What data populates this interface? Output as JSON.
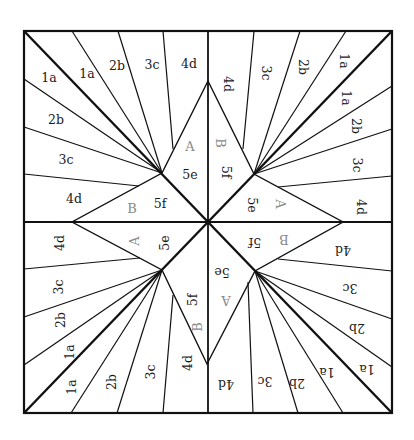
{
  "colors": {
    "line": "#111111",
    "label": "#1a1a1a",
    "section_label": "#8a8a8a",
    "background": "#ffffff"
  },
  "square": {
    "x1": 24,
    "y1": 31,
    "x2": 392,
    "y2": 413
  },
  "center": {
    "x": 208,
    "y": 222
  },
  "star": {
    "outer_points": {
      "top": {
        "x": 208,
        "y": 81
      },
      "right": {
        "x": 343,
        "y": 222
      },
      "bottom": {
        "x": 207,
        "y": 364
      },
      "left": {
        "x": 72,
        "y": 222
      }
    },
    "inner_vertices": {
      "top_left": {
        "x": 162,
        "y": 173
      },
      "top_right": {
        "x": 254,
        "y": 174
      },
      "bottom_left": {
        "x": 162,
        "y": 270
      },
      "bottom_right": {
        "x": 255,
        "y": 271
      }
    }
  },
  "diagonals": [
    {
      "x1": 24,
      "y1": 31,
      "x2": 392,
      "y2": 413
    },
    {
      "x1": 392,
      "y1": 31,
      "x2": 24,
      "y2": 413
    }
  ],
  "fan_lines": [
    {
      "x1": 72,
      "y1": 31,
      "x2": 162,
      "y2": 173
    },
    {
      "x1": 118,
      "y1": 31,
      "x2": 162,
      "y2": 173
    },
    {
      "x1": 163,
      "y1": 31,
      "x2": 173,
      "y2": 149
    },
    {
      "x1": 24,
      "y1": 79,
      "x2": 162,
      "y2": 173
    },
    {
      "x1": 24,
      "y1": 127,
      "x2": 162,
      "y2": 173
    },
    {
      "x1": 24,
      "y1": 174,
      "x2": 139,
      "y2": 186
    },
    {
      "x1": 346,
      "y1": 31,
      "x2": 254,
      "y2": 174
    },
    {
      "x1": 300,
      "y1": 31,
      "x2": 254,
      "y2": 174
    },
    {
      "x1": 254,
      "y1": 31,
      "x2": 243,
      "y2": 149
    },
    {
      "x1": 392,
      "y1": 86,
      "x2": 254,
      "y2": 174
    },
    {
      "x1": 392,
      "y1": 129,
      "x2": 254,
      "y2": 174
    },
    {
      "x1": 392,
      "y1": 176,
      "x2": 278,
      "y2": 187
    },
    {
      "x1": 24,
      "y1": 365,
      "x2": 162,
      "y2": 270
    },
    {
      "x1": 24,
      "y1": 317,
      "x2": 162,
      "y2": 270
    },
    {
      "x1": 24,
      "y1": 269,
      "x2": 140,
      "y2": 258
    },
    {
      "x1": 71,
      "y1": 413,
      "x2": 162,
      "y2": 270
    },
    {
      "x1": 117,
      "y1": 413,
      "x2": 162,
      "y2": 270
    },
    {
      "x1": 163,
      "y1": 413,
      "x2": 173,
      "y2": 295
    },
    {
      "x1": 392,
      "y1": 367,
      "x2": 255,
      "y2": 271
    },
    {
      "x1": 392,
      "y1": 319,
      "x2": 255,
      "y2": 271
    },
    {
      "x1": 392,
      "y1": 271,
      "x2": 278,
      "y2": 259
    },
    {
      "x1": 343,
      "y1": 413,
      "x2": 255,
      "y2": 271
    },
    {
      "x1": 298,
      "y1": 413,
      "x2": 255,
      "y2": 271
    },
    {
      "x1": 253,
      "y1": 413,
      "x2": 248,
      "y2": 282
    }
  ],
  "labels": [
    {
      "text": "1a",
      "x": 49,
      "y": 78,
      "rot": 0,
      "gray": false
    },
    {
      "text": "1a",
      "x": 87,
      "y": 74,
      "rot": 0,
      "gray": false
    },
    {
      "text": "2b",
      "x": 117,
      "y": 66,
      "rot": 0,
      "gray": false
    },
    {
      "text": "3c",
      "x": 152,
      "y": 65,
      "rot": 0,
      "gray": false
    },
    {
      "text": "4d",
      "x": 189,
      "y": 64,
      "rot": 0,
      "gray": false
    },
    {
      "text": "2b",
      "x": 56,
      "y": 120,
      "rot": 0,
      "gray": false
    },
    {
      "text": "3c",
      "x": 66,
      "y": 160,
      "rot": 0,
      "gray": false
    },
    {
      "text": "4d",
      "x": 74,
      "y": 199,
      "rot": 0,
      "gray": false
    },
    {
      "text": "A",
      "x": 190,
      "y": 147,
      "rot": 0,
      "gray": true
    },
    {
      "text": "5e",
      "x": 190,
      "y": 175,
      "rot": 0,
      "gray": false
    },
    {
      "text": "B",
      "x": 132,
      "y": 209,
      "rot": 0,
      "gray": true
    },
    {
      "text": "5f",
      "x": 160,
      "y": 204,
      "rot": 0,
      "gray": false
    },
    {
      "text": "4d",
      "x": 227,
      "y": 84,
      "rot": 90,
      "gray": false
    },
    {
      "text": "3c",
      "x": 265,
      "y": 73,
      "rot": 90,
      "gray": false
    },
    {
      "text": "2b",
      "x": 302,
      "y": 67,
      "rot": 90,
      "gray": false
    },
    {
      "text": "1a",
      "x": 343,
      "y": 61,
      "rot": 90,
      "gray": false
    },
    {
      "text": "1a",
      "x": 345,
      "y": 98,
      "rot": 90,
      "gray": false
    },
    {
      "text": "2b",
      "x": 355,
      "y": 126,
      "rot": 90,
      "gray": false
    },
    {
      "text": "3c",
      "x": 356,
      "y": 165,
      "rot": 90,
      "gray": false
    },
    {
      "text": "4d",
      "x": 360,
      "y": 207,
      "rot": 90,
      "gray": false
    },
    {
      "text": "B",
      "x": 219,
      "y": 143,
      "rot": 90,
      "gray": true
    },
    {
      "text": "5f",
      "x": 225,
      "y": 172,
      "rot": 90,
      "gray": false
    },
    {
      "text": "5e",
      "x": 251,
      "y": 205,
      "rot": 90,
      "gray": false
    },
    {
      "text": "A",
      "x": 279,
      "y": 204,
      "rot": 90,
      "gray": true
    },
    {
      "text": "4d",
      "x": 60,
      "y": 243,
      "rot": -90,
      "gray": false
    },
    {
      "text": "3c",
      "x": 59,
      "y": 287,
      "rot": -90,
      "gray": false
    },
    {
      "text": "2b",
      "x": 61,
      "y": 320,
      "rot": -90,
      "gray": false
    },
    {
      "text": "1a",
      "x": 70,
      "y": 352,
      "rot": -90,
      "gray": false
    },
    {
      "text": "1a",
      "x": 72,
      "y": 387,
      "rot": -90,
      "gray": false
    },
    {
      "text": "2b",
      "x": 112,
      "y": 382,
      "rot": -90,
      "gray": false
    },
    {
      "text": "3c",
      "x": 151,
      "y": 372,
      "rot": -90,
      "gray": false
    },
    {
      "text": "4d",
      "x": 188,
      "y": 363,
      "rot": -90,
      "gray": false
    },
    {
      "text": "A",
      "x": 135,
      "y": 241,
      "rot": -90,
      "gray": true
    },
    {
      "text": "5e",
      "x": 165,
      "y": 243,
      "rot": -90,
      "gray": false
    },
    {
      "text": "5f",
      "x": 193,
      "y": 300,
      "rot": -90,
      "gray": false
    },
    {
      "text": "B",
      "x": 198,
      "y": 327,
      "rot": -90,
      "gray": true
    },
    {
      "text": "5f",
      "x": 255,
      "y": 241,
      "rot": 180,
      "gray": false
    },
    {
      "text": "B",
      "x": 284,
      "y": 238,
      "rot": 180,
      "gray": true
    },
    {
      "text": "4d",
      "x": 343,
      "y": 249,
      "rot": 180,
      "gray": false
    },
    {
      "text": "5e",
      "x": 222,
      "y": 271,
      "rot": 180,
      "gray": false
    },
    {
      "text": "A",
      "x": 226,
      "y": 299,
      "rot": 180,
      "gray": true
    },
    {
      "text": "3c",
      "x": 350,
      "y": 287,
      "rot": 180,
      "gray": false
    },
    {
      "text": "2b",
      "x": 357,
      "y": 327,
      "rot": 180,
      "gray": false
    },
    {
      "text": "1a",
      "x": 367,
      "y": 368,
      "rot": 180,
      "gray": false
    },
    {
      "text": "1a",
      "x": 327,
      "y": 371,
      "rot": 180,
      "gray": false
    },
    {
      "text": "2b",
      "x": 297,
      "y": 382,
      "rot": 180,
      "gray": false
    },
    {
      "text": "3c",
      "x": 265,
      "y": 380,
      "rot": 180,
      "gray": false
    },
    {
      "text": "4d",
      "x": 226,
      "y": 383,
      "rot": 180,
      "gray": false
    }
  ]
}
